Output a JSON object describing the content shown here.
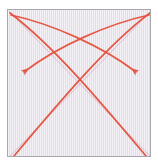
{
  "figure": {
    "title": "",
    "caption": "",
    "background_color": "#ffffff",
    "panel_color": "#e9e3ef",
    "border_color": "#a9a6ad"
  },
  "chart_data": {
    "type": "line",
    "title": "",
    "subtitle": "",
    "xlabel": "",
    "ylabel": "",
    "xlim": [
      0,
      144
    ],
    "ylim": [
      0,
      148
    ],
    "grid": false,
    "legend_position": "none",
    "tick_labels": {
      "x": [],
      "y": []
    },
    "annotations": [],
    "series": [
      {
        "name": "diagonal-tl-br",
        "kind": "straight-line",
        "color": "#dba6bd",
        "width": 0.9,
        "opacity": 0.75,
        "arrowhead": false,
        "points": [
          [
            1,
            1
          ],
          [
            143,
            147
          ]
        ]
      },
      {
        "name": "diagonal-tr-bl",
        "kind": "straight-line",
        "color": "#dba6bd",
        "width": 0.9,
        "opacity": 0.75,
        "arrowhead": false,
        "points": [
          [
            143,
            1
          ],
          [
            1,
            147
          ]
        ]
      },
      {
        "name": "arc-tl-to-br",
        "kind": "curve",
        "color": "#e2503c",
        "width": 1.7,
        "opacity": 0.95,
        "arrowhead": false,
        "path": "M 2 3 C 46 36, 96 96, 138 146"
      },
      {
        "name": "arc-tr-to-bl",
        "kind": "curve",
        "color": "#e2503c",
        "width": 1.7,
        "opacity": 0.95,
        "arrowhead": false,
        "path": "M 142 3 C 98 36, 48 96, 6 146"
      },
      {
        "name": "arrow-tr-to-left",
        "kind": "curve-arrow",
        "color": "#e4533e",
        "width": 1.7,
        "opacity": 0.95,
        "arrowhead": true,
        "arrow_tip": [
          13,
          63
        ],
        "path": "M 141 5 C 100 14, 50 36, 16 62"
      },
      {
        "name": "arrow-tl-to-right",
        "kind": "curve-arrow",
        "color": "#e4533e",
        "width": 1.7,
        "opacity": 0.95,
        "arrowhead": true,
        "arrow_tip": [
          131,
          63
        ],
        "path": "M 3 5 C 44 14, 94 36, 128 62"
      }
    ]
  },
  "accessibility": {
    "figure_description": "Square lavender panel with two faint pink corner-to-corner diagonals and four red curves: two arcs spanning opposite corners and two arrowed curves ending in arrowheads on the left and right sides."
  }
}
